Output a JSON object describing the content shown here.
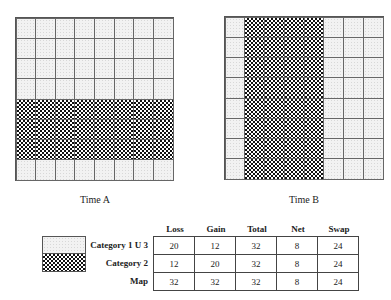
{
  "panels": [
    {
      "caption": "Time A",
      "rows": 8,
      "cols": 8,
      "dark_rows": [
        4,
        5,
        6
      ],
      "dark_cols": []
    },
    {
      "caption": "Time B",
      "rows": 8,
      "cols": 8,
      "dark_rows": [],
      "dark_cols": [
        1,
        2,
        3,
        4
      ]
    }
  ],
  "legend": {
    "category1": "Category 1 U 3",
    "category2": "Category 2",
    "map": "Map"
  },
  "table": {
    "headers": [
      "Loss",
      "Gain",
      "Total",
      "Net",
      "Swap"
    ],
    "rows": [
      {
        "label": "Category 1 U 3",
        "values": [
          "20",
          "12",
          "32",
          "8",
          "24"
        ]
      },
      {
        "label": "Category 2",
        "values": [
          "12",
          "20",
          "32",
          "8",
          "24"
        ]
      },
      {
        "label": "Map",
        "values": [
          "32",
          "32",
          "32",
          "8",
          "24"
        ]
      }
    ]
  },
  "colors": {
    "light_pattern": "#f2f2f2",
    "dark_pattern": "#111111",
    "grid_line": "#666666"
  }
}
